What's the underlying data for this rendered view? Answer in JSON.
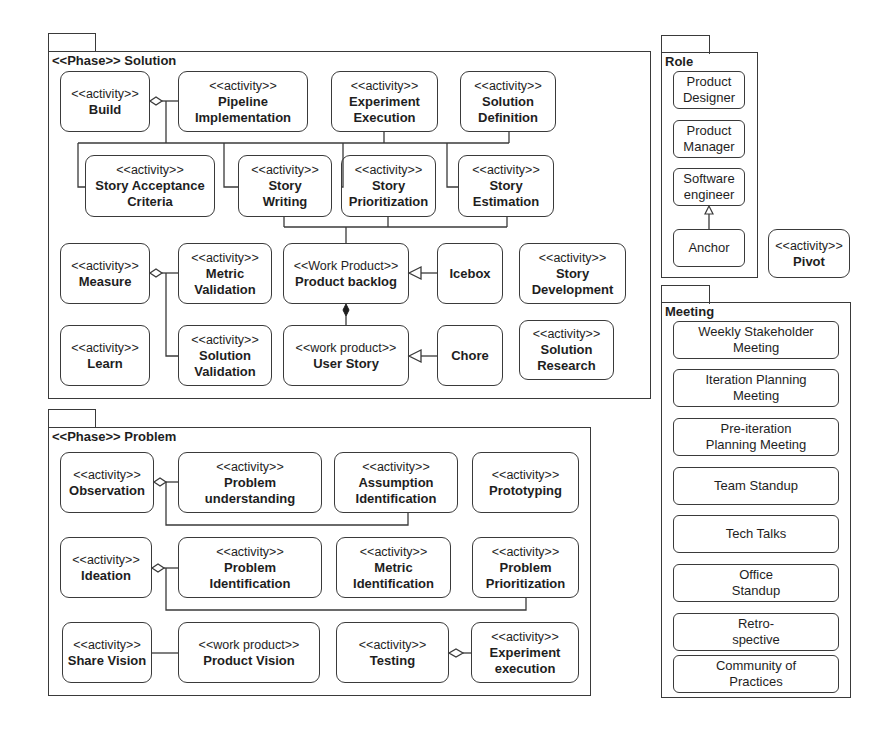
{
  "solution": {
    "title": "<<Phase>> Solution",
    "nodes": {
      "build": {
        "stereotype": "<<activity>>",
        "name": "Build"
      },
      "pipeline": {
        "stereotype": "<<activity>>",
        "name": "Pipeline Implementation"
      },
      "experiment_execution": {
        "stereotype": "<<activity>>",
        "name": "Experiment Execution"
      },
      "solution_definition": {
        "stereotype": "<<activity>>",
        "name": "Solution Definition"
      },
      "story_acceptance": {
        "stereotype": "<<activity>>",
        "name": "Story Acceptance Criteria"
      },
      "story_writing": {
        "stereotype": "<<activity>>",
        "name": "Story Writing"
      },
      "story_prioritization": {
        "stereotype": "<<activity>>",
        "name": "Story Prioritization"
      },
      "story_estimation": {
        "stereotype": "<<activity>>",
        "name": "Story Estimation"
      },
      "measure": {
        "stereotype": "<<activity>>",
        "name": "Measure"
      },
      "metric_validation": {
        "stereotype": "<<activity>>",
        "name": "Metric Validation"
      },
      "product_backlog": {
        "stereotype": "<<Work Product>>",
        "name": "Product backlog"
      },
      "icebox": {
        "name": "Icebox"
      },
      "story_development": {
        "stereotype": "<<activity>>",
        "name": "Story Development"
      },
      "learn": {
        "stereotype": "<<activity>>",
        "name": "Learn"
      },
      "solution_validation": {
        "stereotype": "<<activity>>",
        "name": "Solution Validation"
      },
      "user_story": {
        "stereotype": "<<work product>>",
        "name": "User Story"
      },
      "chore": {
        "name": "Chore"
      },
      "solution_research": {
        "stereotype": "<<activity>>",
        "name": "Solution Research"
      }
    }
  },
  "problem": {
    "title": "<<Phase>> Problem",
    "nodes": {
      "observation": {
        "stereotype": "<<activity>>",
        "name": "Observation"
      },
      "problem_understanding": {
        "stereotype": "<<activity>>",
        "name": "Problem understanding"
      },
      "assumption_identification": {
        "stereotype": "<<activity>>",
        "name": "Assumption Identification"
      },
      "prototyping": {
        "stereotype": "<<activity>>",
        "name": "Prototyping"
      },
      "ideation": {
        "stereotype": "<<activity>>",
        "name": "Ideation"
      },
      "problem_identification": {
        "stereotype": "<<activity>>",
        "name": "Problem Identification"
      },
      "metric_identification": {
        "stereotype": "<<activity>>",
        "name": "Metric Identification"
      },
      "problem_prioritization": {
        "stereotype": "<<activity>>",
        "name": "Problem Prioritization"
      },
      "share_vision": {
        "stereotype": "<<activity>>",
        "name": "Share Vision"
      },
      "product_vision": {
        "stereotype": "<<work product>>",
        "name": "Product Vision"
      },
      "testing": {
        "stereotype": "<<activity>>",
        "name": "Testing"
      },
      "experiment_execution_lc": {
        "stereotype": "<<activity>>",
        "name": "Experiment execution"
      }
    }
  },
  "role": {
    "title": "Role",
    "items": [
      "Product Designer",
      "Product Manager",
      "Software engineer",
      "Anchor"
    ]
  },
  "pivot": {
    "stereotype": "<<activity>>",
    "name": "Pivot"
  },
  "meeting": {
    "title": "Meeting",
    "items": [
      "Weekly Stakeholder Meeting",
      "Iteration Planning Meeting",
      "Pre-iteration Planning Meeting",
      "Team Standup",
      "Tech Talks",
      "Office Standup",
      "Retro-spective",
      "Community of Practices"
    ]
  },
  "relations": [
    {
      "type": "aggregation",
      "whole": "Build",
      "parts": [
        "Pipeline Implementation",
        "Experiment Execution",
        "Solution Definition",
        "Story Acceptance Criteria",
        "Story Writing",
        "Story Prioritization",
        "Story Estimation"
      ]
    },
    {
      "type": "association",
      "from": "Story Writing / Story Prioritization / Story Estimation",
      "to": "Product backlog"
    },
    {
      "type": "aggregation",
      "whole": "Measure",
      "parts": [
        "Metric Validation",
        "Solution Validation"
      ]
    },
    {
      "type": "composition",
      "whole": "Product backlog",
      "part": "User Story"
    },
    {
      "type": "generalization",
      "child": "Icebox",
      "parent": "Product backlog"
    },
    {
      "type": "generalization",
      "child": "Chore",
      "parent": "User Story"
    },
    {
      "type": "generalization",
      "child": "Anchor",
      "parent": "Software engineer"
    },
    {
      "type": "aggregation",
      "whole": "Observation",
      "parts": [
        "Problem understanding",
        "Assumption Identification"
      ]
    },
    {
      "type": "aggregation",
      "whole": "Ideation",
      "parts": [
        "Problem Identification",
        "Metric Identification",
        "Problem Prioritization"
      ]
    },
    {
      "type": "association",
      "from": "Share Vision",
      "to": "Product Vision"
    },
    {
      "type": "aggregation",
      "whole": "Testing",
      "parts": [
        "Experiment execution"
      ]
    }
  ]
}
